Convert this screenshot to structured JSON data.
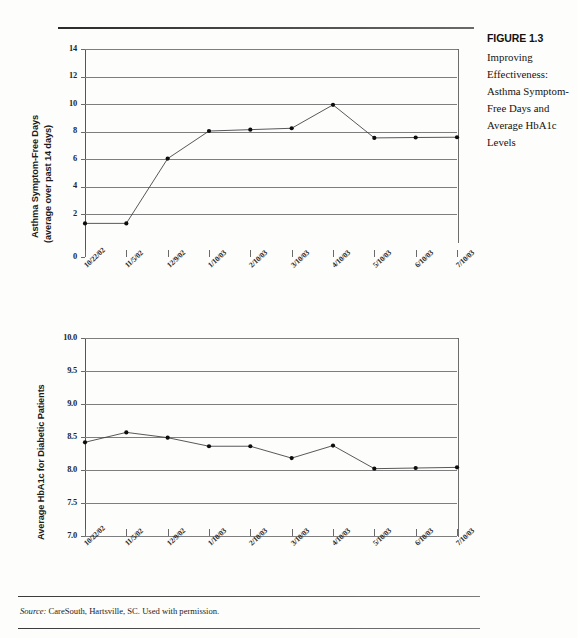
{
  "figure": {
    "number_label": "FIGURE 1.3",
    "caption": "Improving Effectiveness: Asthma Symptom-Free Days and Average HbA1c Levels"
  },
  "source_note": {
    "label": "Source:",
    "text": " CareSouth, Hartsville, SC. Used with permission."
  },
  "chart_data": [
    {
      "type": "line",
      "title": "",
      "xlabel": "",
      "ylabel_line1": "Asthma Symptom-Free Days",
      "ylabel_line2": "(average over past 14 days)",
      "categories": [
        "10/22/02",
        "11/5/02",
        "12/9/02",
        "1/10/03",
        "2/10/03",
        "3/10/03",
        "4/10/03",
        "5/10/03",
        "6/10/03",
        "7/10/03"
      ],
      "values": [
        1.35,
        1.35,
        6.05,
        8.05,
        8.15,
        8.25,
        9.95,
        7.55,
        7.58,
        7.6
      ],
      "ylim": [
        0,
        14
      ],
      "yticks": [
        0,
        2,
        4,
        6,
        8,
        10,
        12,
        14
      ],
      "ytick_labels": [
        "0",
        "2",
        "4",
        "6",
        "8",
        "10",
        "12",
        "14"
      ],
      "grid": true,
      "legend": "none"
    },
    {
      "type": "line",
      "title": "",
      "xlabel": "",
      "ylabel_line1": "Average HbA1c for Diabetic Patients",
      "ylabel_line2": "",
      "categories": [
        "10/22/02",
        "11/5/02",
        "12/9/02",
        "1/10/03",
        "2/10/03",
        "3/10/03",
        "4/10/03",
        "5/10/03",
        "6/10/03",
        "7/10/03"
      ],
      "values": [
        8.42,
        8.57,
        8.49,
        8.36,
        8.36,
        8.18,
        8.37,
        8.02,
        8.03,
        8.04
      ],
      "ylim": [
        7.0,
        10.0
      ],
      "yticks": [
        7.0,
        7.5,
        8.0,
        8.5,
        9.0,
        9.5,
        10.0
      ],
      "ytick_labels": [
        "7.0",
        "7.5",
        "8.0",
        "8.5",
        "9.0",
        "9.5",
        "10.0"
      ],
      "grid": true,
      "legend": "none"
    }
  ]
}
